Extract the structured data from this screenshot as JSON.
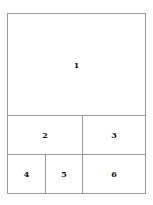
{
  "diagram": {
    "type": "grid-layout",
    "panels": [
      {
        "id": "1",
        "label": "1"
      },
      {
        "id": "2",
        "label": "2"
      },
      {
        "id": "3",
        "label": "3"
      },
      {
        "id": "4",
        "label": "4"
      },
      {
        "id": "5",
        "label": "5"
      },
      {
        "id": "6",
        "label": "6"
      }
    ],
    "line_color": "#9a9a9a",
    "text_color": "#111111",
    "background": "#ffffff"
  }
}
